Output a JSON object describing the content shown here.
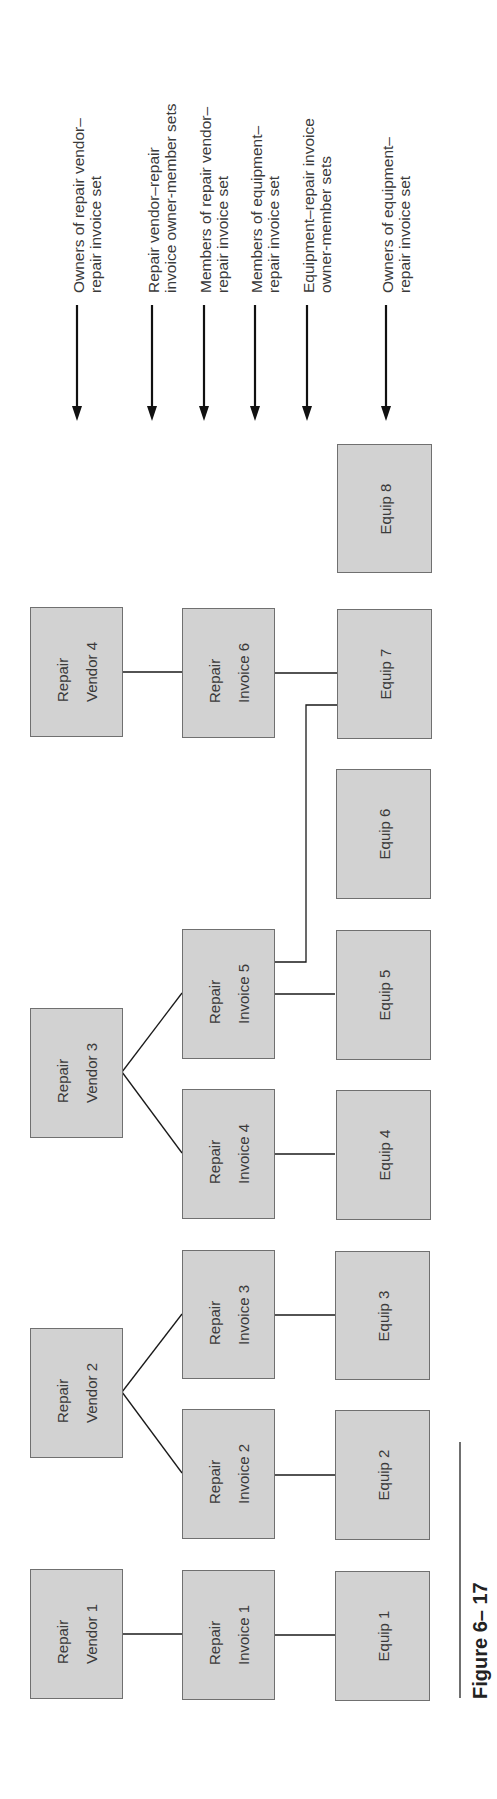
{
  "figure": {
    "caption": "Figure 6– 17"
  },
  "row_labels": [
    {
      "text": "Owners of repair vendor–\nrepair invoice set",
      "x": 77
    },
    {
      "text": "Repair vendor–repair\ninvoice owner-member sets",
      "x": 152
    },
    {
      "text": "Members of repair vendor–\nrepair invoice set",
      "x": 204
    },
    {
      "text": "Members of equipment–\nrepair invoice set",
      "x": 255
    },
    {
      "text": "Equipment–repair invoice\nowner-member sets",
      "x": 307
    },
    {
      "text": "Owners of equipment–\nrepair invoice set",
      "x": 386
    }
  ],
  "nodes": {
    "vendor1": {
      "label": "Repair\nVendor 1"
    },
    "vendor2": {
      "label": "Repair\nVendor 2"
    },
    "vendor3": {
      "label": "Repair\nVendor 3"
    },
    "vendor4": {
      "label": "Repair\nVendor 4"
    },
    "invoice1": {
      "label": "Repair\nInvoice 1"
    },
    "invoice2": {
      "label": "Repair\nInvoice 2"
    },
    "invoice3": {
      "label": "Repair\nInvoice 3"
    },
    "invoice4": {
      "label": "Repair\nInvoice 4"
    },
    "invoice5": {
      "label": "Repair\nInvoice 5"
    },
    "invoice6": {
      "label": "Repair\nInvoice 6"
    },
    "equip1": {
      "label": "Equip 1"
    },
    "equip2": {
      "label": "Equip 2"
    },
    "equip3": {
      "label": "Equip 3"
    },
    "equip4": {
      "label": "Equip 4"
    },
    "equip5": {
      "label": "Equip 5"
    },
    "equip6": {
      "label": "Equip 6"
    },
    "equip7": {
      "label": "Equip 7"
    },
    "equip8": {
      "label": "Equip 8"
    }
  },
  "edges": [
    [
      "vendor1",
      "invoice1"
    ],
    [
      "vendor2",
      "invoice2"
    ],
    [
      "vendor2",
      "invoice3"
    ],
    [
      "vendor3",
      "invoice4"
    ],
    [
      "vendor3",
      "invoice5"
    ],
    [
      "vendor4",
      "invoice6"
    ],
    [
      "invoice1",
      "equip1"
    ],
    [
      "invoice2",
      "equip2"
    ],
    [
      "invoice3",
      "equip3"
    ],
    [
      "invoice4",
      "equip4"
    ],
    [
      "invoice5",
      "equip5"
    ],
    [
      "invoice5",
      "equip7"
    ],
    [
      "invoice6",
      "equip7"
    ]
  ],
  "colors": {
    "box_fill": "#d2d2d2",
    "box_border": "#707070",
    "line": "#1a1a1a",
    "text": "#3a3a3a"
  }
}
